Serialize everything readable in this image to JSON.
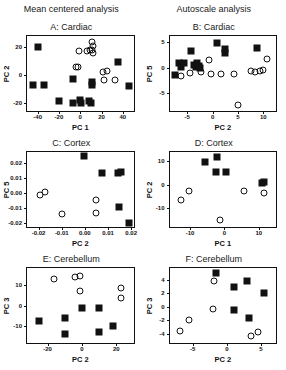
{
  "figure": {
    "column_headers": [
      "Mean centered analysis",
      "Autoscale analysis"
    ]
  },
  "chart_data": [
    {
      "type": "scatter",
      "panel": "A",
      "title": "A: Cardiac",
      "column_header": "Mean centered analysis",
      "xlabel": "PC 1",
      "ylabel": "PC 2",
      "xlim": [
        -50,
        50
      ],
      "ylim": [
        -26,
        28
      ],
      "xticks": [
        -40,
        -20,
        0,
        20,
        40
      ],
      "yticks": [
        -20,
        0,
        20
      ],
      "grid": false,
      "legend": "none",
      "series": [
        {
          "name": "squares",
          "marker": "filled-square",
          "color": "#111111",
          "points": [
            [
              -40,
              20
            ],
            [
              -44,
              -7
            ],
            [
              -34,
              -7
            ],
            [
              -20,
              -19
            ],
            [
              -7,
              -3
            ],
            [
              -7,
              -20
            ],
            [
              0,
              -18
            ],
            [
              1,
              -20
            ],
            [
              8,
              -19
            ],
            [
              10,
              -20
            ],
            [
              11,
              -5
            ],
            [
              11,
              -7
            ],
            [
              35,
              9
            ],
            [
              46,
              -8
            ]
          ]
        },
        {
          "name": "circles",
          "marker": "open-circle",
          "color": "#111111",
          "points": [
            [
              -4,
              6
            ],
            [
              -2,
              6
            ],
            [
              -1,
              17
            ],
            [
              6,
              17
            ],
            [
              9,
              18
            ],
            [
              11,
              18
            ],
            [
              12,
              16
            ],
            [
              11,
              24
            ],
            [
              12,
              21
            ],
            [
              21,
              2
            ],
            [
              22,
              -4
            ],
            [
              25,
              3
            ],
            [
              33,
              -4
            ]
          ]
        }
      ]
    },
    {
      "type": "scatter",
      "panel": "B",
      "title": "B: Cardiac",
      "column_header": "Autoscale analysis",
      "xlabel": "PC 2",
      "ylabel": "PC 5",
      "xlim": [
        -8.5,
        12.5
      ],
      "ylim": [
        -8.5,
        6.2
      ],
      "xticks": [
        -5,
        0,
        5,
        10
      ],
      "yticks": [
        -5,
        0,
        5
      ],
      "grid": false,
      "legend": "none",
      "series": [
        {
          "name": "squares",
          "marker": "filled-square",
          "color": "#111111",
          "points": [
            [
              -7.5,
              -1.4
            ],
            [
              -6.6,
              0.9
            ],
            [
              -6.2,
              0.2
            ],
            [
              -5.6,
              1.0
            ],
            [
              -4.2,
              3.2
            ],
            [
              -3.6,
              0.6
            ],
            [
              -3.2,
              0.2
            ],
            [
              -3.0,
              0.9
            ],
            [
              -2.6,
              0.4
            ],
            [
              -2.4,
              0.0
            ],
            [
              0.8,
              4.9
            ],
            [
              2.4,
              2.9
            ],
            [
              2.5,
              3.6
            ],
            [
              8.8,
              3.9
            ]
          ]
        },
        {
          "name": "circles",
          "marker": "open-circle",
          "color": "#111111",
          "points": [
            [
              -6.2,
              -1.6
            ],
            [
              -4.4,
              -1.0
            ],
            [
              -2.2,
              -0.9
            ],
            [
              -0.8,
              1.4
            ],
            [
              -0.4,
              -1.2
            ],
            [
              1.6,
              -1.3
            ],
            [
              4.2,
              -1.2
            ],
            [
              5.0,
              -7.4
            ],
            [
              7.6,
              -0.7
            ],
            [
              8.4,
              -0.8
            ],
            [
              9.4,
              -0.6
            ],
            [
              10.0,
              -0.5
            ],
            [
              10.8,
              1.7
            ]
          ]
        }
      ]
    },
    {
      "type": "scatter",
      "panel": "C",
      "title": "C: Cortex",
      "column_header": "Mean centered analysis",
      "xlabel": "PC 2",
      "ylabel": "PC 5",
      "xlim": [
        -0.025,
        0.021
      ],
      "ylim": [
        -0.023,
        0.027
      ],
      "xticks": [
        -0.02,
        -0.01,
        0.0,
        0.01,
        0.02
      ],
      "yticks": [
        0.02,
        0.01,
        0.0,
        -0.01,
        -0.02
      ],
      "xticklabels": [
        "-0.02",
        "-0.01",
        "0.00",
        "0.01",
        "0.02"
      ],
      "yticklabels": [
        "0.02",
        "0.01",
        "0.00",
        "-0.01",
        "-0.02"
      ],
      "grid": false,
      "legend": "none",
      "series": [
        {
          "name": "squares",
          "marker": "filled-square",
          "color": "#111111",
          "points": [
            [
              -0.0005,
              0.0245
            ],
            [
              0.0075,
              0.0128
            ],
            [
              0.0142,
              0.0132
            ],
            [
              0.0155,
              0.0138
            ],
            [
              0.0148,
              -0.0098
            ],
            [
              0.0192,
              -0.0205
            ]
          ]
        },
        {
          "name": "circles",
          "marker": "open-circle",
          "color": "#111111",
          "points": [
            [
              -0.0192,
              -0.0015
            ],
            [
              -0.0172,
              0.0005
            ],
            [
              -0.0098,
              -0.0142
            ],
            [
              0.0046,
              -0.0048
            ],
            [
              0.0048,
              -0.0135
            ]
          ]
        }
      ]
    },
    {
      "type": "scatter",
      "panel": "D",
      "title": "D: Cortex",
      "column_header": "Autoscale analysis",
      "xlabel": "PC 1",
      "ylabel": "PC 2",
      "xlim": [
        -16,
        15
      ],
      "ylim": [
        -18,
        14
      ],
      "xticks": [
        -10,
        0,
        10
      ],
      "yticks": [
        10,
        0,
        -10
      ],
      "grid": false,
      "legend": "none",
      "series": [
        {
          "name": "squares",
          "marker": "filled-square",
          "color": "#111111",
          "points": [
            [
              -5.6,
              9.6
            ],
            [
              -2.2,
              11.8
            ],
            [
              -2.6,
              5.6
            ],
            [
              0.4,
              5.6
            ],
            [
              11.0,
              0.6
            ],
            [
              11.4,
              1.4
            ]
          ]
        },
        {
          "name": "circles",
          "marker": "open-circle",
          "color": "#111111",
          "points": [
            [
              -12.6,
              -6.6
            ],
            [
              -10.2,
              -2.6
            ],
            [
              -1.4,
              -14.8
            ],
            [
              5.6,
              -2.6
            ],
            [
              11.4,
              -3.4
            ]
          ]
        }
      ]
    },
    {
      "type": "scatter",
      "panel": "E",
      "title": "E: Cerebellum",
      "column_header": "Mean centered analysis",
      "xlabel": "PC 2",
      "ylabel": "PC 3",
      "xlim": [
        -32,
        30
      ],
      "ylim": [
        -18,
        18
      ],
      "xticks": [
        -20,
        0,
        20
      ],
      "yticks": [
        10,
        0,
        -10
      ],
      "grid": false,
      "legend": "none",
      "series": [
        {
          "name": "squares",
          "marker": "filled-square",
          "color": "#111111",
          "points": [
            [
              -25,
              -7.6
            ],
            [
              -10,
              -6.2
            ],
            [
              -10,
              -13.8
            ],
            [
              0,
              -1.2
            ],
            [
              10,
              -1.0
            ],
            [
              10,
              -12.8
            ],
            [
              18,
              -9.6
            ]
          ]
        },
        {
          "name": "circles",
          "marker": "open-circle",
          "color": "#111111",
          "points": [
            [
              -16,
              12.6
            ],
            [
              -4,
              13.6
            ],
            [
              -1,
              14.4
            ],
            [
              -1,
              6.8
            ],
            [
              23,
              8.4
            ],
            [
              23,
              3.6
            ]
          ]
        }
      ]
    },
    {
      "type": "scatter",
      "panel": "F",
      "title": "F: Cerebellum",
      "column_header": "Autoscale analysis",
      "xlabel": "PC 2",
      "ylabel": "PC 3",
      "xlim": [
        -8.4,
        7.2
      ],
      "ylim": [
        -5.4,
        5.8
      ],
      "xticks": [
        -5,
        0,
        5
      ],
      "yticks": [
        4,
        2,
        0,
        -2,
        -4
      ],
      "grid": false,
      "legend": "none",
      "series": [
        {
          "name": "squares",
          "marker": "filled-square",
          "color": "#111111",
          "points": [
            [
              -1.6,
              5.0
            ],
            [
              1.1,
              3.0
            ],
            [
              3.0,
              3.9
            ],
            [
              5.5,
              2.0
            ],
            [
              1.1,
              -0.4
            ],
            [
              3.2,
              -1.7
            ]
          ]
        },
        {
          "name": "circles",
          "marker": "open-circle",
          "color": "#111111",
          "points": [
            [
              -1.9,
              3.8
            ],
            [
              -2.1,
              -0.3
            ],
            [
              -5.5,
              -2.0
            ],
            [
              -6.9,
              -3.6
            ],
            [
              3.5,
              -4.3
            ],
            [
              4.6,
              -3.8
            ]
          ]
        }
      ]
    }
  ]
}
